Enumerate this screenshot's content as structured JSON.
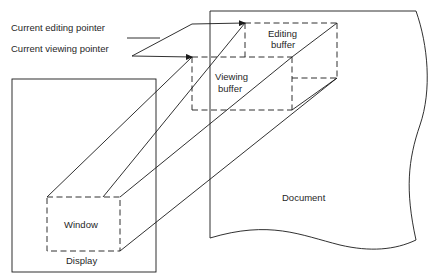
{
  "diagram": {
    "labels": {
      "editing_pointer": "Current editing pointer",
      "viewing_pointer": "Current viewing pointer",
      "editing_buffer_line1": "Editing",
      "editing_buffer_line2": "buffer",
      "viewing_buffer_line1": "Viewing",
      "viewing_buffer_line2": "buffer",
      "window": "Window",
      "display": "Display",
      "document": "Document"
    },
    "colors": {
      "stroke": "#1a1a1a",
      "text": "#1f1f1f",
      "background": "#ffffff"
    }
  }
}
